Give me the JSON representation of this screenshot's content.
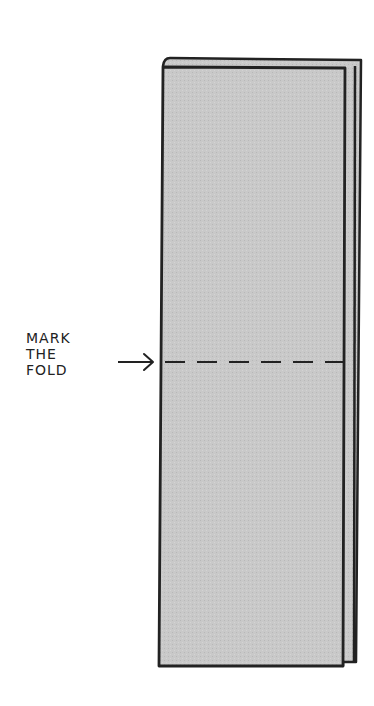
{
  "diagram": {
    "type": "instruction-illustration",
    "annotation": {
      "lines": [
        "MARK",
        "THE",
        "FOLD"
      ],
      "arrow": "right-arrow"
    },
    "fold_line_style": "dashed",
    "colors": {
      "paper_fill": "#c8c8c8",
      "outline": "#222222",
      "background": "#ffffff"
    }
  }
}
